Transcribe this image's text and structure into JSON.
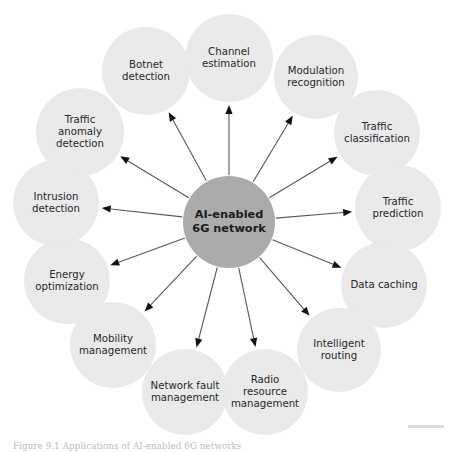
{
  "figure": {
    "caption": "Figure 9.1 Applications of AI-enabled 6G networks",
    "hub": {
      "label_line1": "AI-enabled",
      "label_line2": "6G network",
      "cx": 229,
      "cy": 222,
      "r": 46,
      "color": "#ababab"
    },
    "node_color": "#e9e9e9",
    "line_color": "#55585c",
    "arrow_color": "#111316",
    "text_color": "#26282b",
    "nodes": [
      {
        "id": "channel-estimation",
        "lines": [
          "Channel",
          "estimation"
        ],
        "cx": 229,
        "cy": 58,
        "r": 44,
        "angle": -90
      },
      {
        "id": "modulation-recognition",
        "lines": [
          "Modulation",
          "recognition"
        ],
        "cx": 316,
        "cy": 77,
        "r": 42,
        "angle": -64
      },
      {
        "id": "traffic-classification",
        "lines": [
          "Traffic",
          "classification"
        ],
        "cx": 377,
        "cy": 133,
        "r": 43,
        "angle": -38
      },
      {
        "id": "traffic-prediction",
        "lines": [
          "Traffic",
          "prediction"
        ],
        "cx": 398,
        "cy": 208,
        "r": 43,
        "angle": -12
      },
      {
        "id": "data-caching",
        "lines": [
          "Data caching"
        ],
        "cx": 384,
        "cy": 285,
        "r": 43,
        "angle": 14
      },
      {
        "id": "intelligent-routing",
        "lines": [
          "Intelligent",
          "routing"
        ],
        "cx": 339,
        "cy": 350,
        "r": 42,
        "angle": 40
      },
      {
        "id": "radio-resource-management",
        "lines": [
          "Radio",
          "resource",
          "management"
        ],
        "cx": 265,
        "cy": 392,
        "r": 43,
        "angle": 66
      },
      {
        "id": "network-fault-management",
        "lines": [
          "Network fault",
          "management"
        ],
        "cx": 185,
        "cy": 392,
        "r": 43,
        "angle": 104
      },
      {
        "id": "mobility-management",
        "lines": [
          "Mobility",
          "management"
        ],
        "cx": 113,
        "cy": 345,
        "r": 43,
        "angle": 133
      },
      {
        "id": "energy-optimization",
        "lines": [
          "Energy",
          "optimization"
        ],
        "cx": 67,
        "cy": 281,
        "r": 43,
        "angle": 158
      },
      {
        "id": "intrusion-detection",
        "lines": [
          "Intrusion",
          "detection"
        ],
        "cx": 56,
        "cy": 203,
        "r": 43,
        "angle": 183
      },
      {
        "id": "traffic-anomaly-detection",
        "lines": [
          "Traffic",
          "anomaly",
          "detection"
        ],
        "cx": 80,
        "cy": 132,
        "r": 44,
        "angle": 208
      },
      {
        "id": "botnet-detection",
        "lines": [
          "Botnet",
          "detection"
        ],
        "cx": 146,
        "cy": 71,
        "r": 44,
        "angle": 234
      }
    ]
  }
}
